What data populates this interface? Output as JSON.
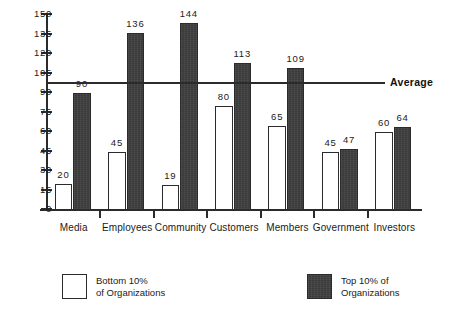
{
  "chart_data": {
    "type": "bar",
    "title": "",
    "xlabel": "",
    "ylabel": "",
    "categories": [
      "Media",
      "Employees",
      "Community",
      "Customers",
      "Members",
      "Government",
      "Investors"
    ],
    "series": [
      {
        "name": "Bottom 10% of Organizations",
        "values": [
          20,
          45,
          19,
          80,
          65,
          45,
          60
        ]
      },
      {
        "name": "Top 10% of Organizations",
        "values": [
          90,
          136,
          144,
          113,
          109,
          47,
          64
        ]
      }
    ],
    "ylim": [
      0,
      150
    ],
    "yticks": [
      0,
      15,
      30,
      45,
      60,
      75,
      90,
      105,
      120,
      135,
      150
    ],
    "grid": false,
    "legend_position": "bottom",
    "annotations": [
      {
        "name": "average-line",
        "label": "Average",
        "value": 97
      }
    ]
  },
  "legend": {
    "items": [
      {
        "swatch": "white-box",
        "line1": "Bottom  10%",
        "line2": "of  Organizations"
      },
      {
        "swatch": "dark-box",
        "line1": "Top 10% of",
        "line2": "Organizations"
      }
    ]
  },
  "colors": {
    "low_fill": "#ffffff",
    "high_fill": "#3a3a3a",
    "axis": "#2b2b2b",
    "text": "#1a1a1a",
    "background": "#ffffff"
  }
}
